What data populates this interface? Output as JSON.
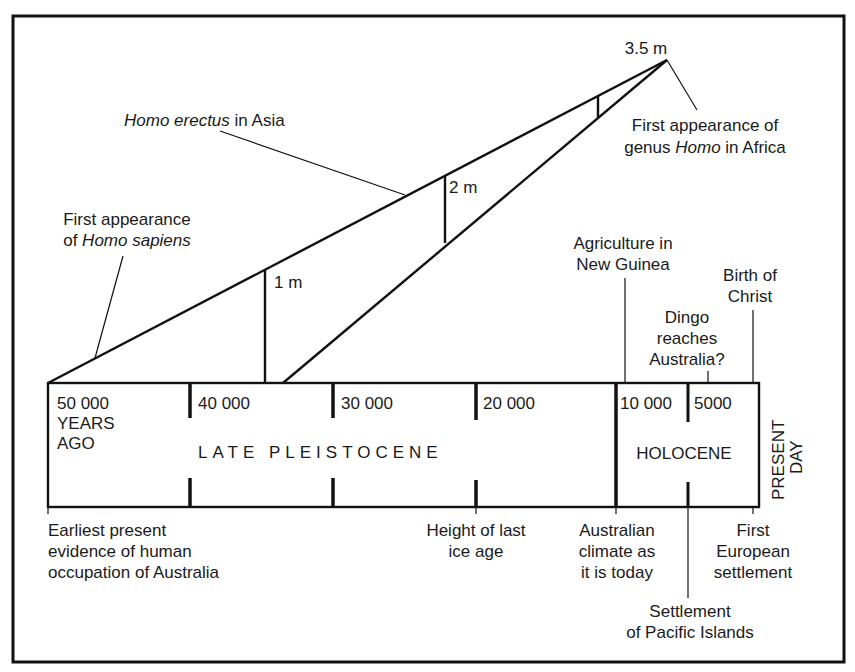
{
  "diagram": {
    "scale_bar": {
      "apex_label": "3.5 m",
      "marks": [
        {
          "label": "1 m"
        },
        {
          "label": "2 m"
        }
      ]
    },
    "upper_annotations": {
      "homo_erectus": {
        "italic": "Homo erectus",
        "rest": " in Asia"
      },
      "homo_sapiens": {
        "line1": "First appearance",
        "line2_pre": "of ",
        "line2_italic": "Homo sapiens"
      },
      "genus_homo": {
        "line1": "First appearance of",
        "line2_pre": "genus ",
        "line2_italic": "Homo",
        "line2_post": " in Africa"
      },
      "agriculture": {
        "line1": "Agriculture in",
        "line2": "New Guinea"
      },
      "birth_of_christ": {
        "line1": "Birth of",
        "line2": "Christ"
      },
      "dingo": {
        "line1": "Dingo",
        "line2": "reaches",
        "line3": "Australia?"
      }
    },
    "timeline": {
      "ticks": [
        {
          "label": "50 000",
          "extra1": "YEARS",
          "extra2": "AGO"
        },
        {
          "label": "40 000"
        },
        {
          "label": "30 000"
        },
        {
          "label": "20 000"
        },
        {
          "label": "10 000"
        },
        {
          "label": "5000"
        }
      ],
      "eras": {
        "late_pleistocene": "LATE PLEISTOCENE",
        "holocene": "HOLOCENE"
      },
      "present_day": {
        "line1": "PRESENT",
        "line2": "DAY"
      }
    },
    "lower_annotations": {
      "earliest_evidence": {
        "line1": "Earliest present",
        "line2": "evidence of human",
        "line3": "occupation of Australia"
      },
      "ice_age": {
        "line1": "Height of last",
        "line2": "ice age"
      },
      "climate": {
        "line1": "Australian",
        "line2": "climate as",
        "line3": "it is today"
      },
      "european": {
        "line1": "First",
        "line2": "European",
        "line3": "settlement"
      },
      "pacific": {
        "line1": "Settlement",
        "line2": "of Pacific Islands"
      }
    }
  }
}
